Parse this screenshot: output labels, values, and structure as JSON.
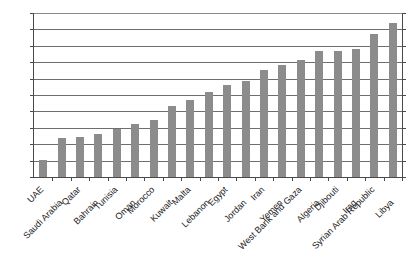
{
  "chart_data": {
    "type": "bar",
    "title": "",
    "subtitle": "",
    "xlabel": "",
    "ylabel": "",
    "ylim": [
      0,
      200
    ],
    "ytick_step": 20,
    "yticks": [
      0,
      20,
      40,
      60,
      80,
      100,
      120,
      140,
      160,
      180,
      200
    ],
    "grid": true,
    "legend": "none",
    "bar_color": "#8c8c8c",
    "axis_color": "#4a4a4a",
    "gridline_color": "#6e6e6e",
    "categories": [
      "UAE",
      "Saudi Arabia",
      "Qatar",
      "Bahrain",
      "Tunisia",
      "Oman",
      "Morocco",
      "Kuwait",
      "Malta",
      "Lebanon",
      "Egypt",
      "Jordan",
      "Iran",
      "Yemen",
      "West Bank and Gaza",
      "Algeria",
      "Djibouti",
      "Iraq",
      "Syrian Arab Republic",
      "Libya"
    ],
    "values": [
      21,
      48,
      49,
      52,
      59,
      65,
      70,
      86,
      94,
      104,
      112,
      117,
      130,
      137,
      143,
      154,
      154,
      156,
      175,
      188
    ]
  }
}
